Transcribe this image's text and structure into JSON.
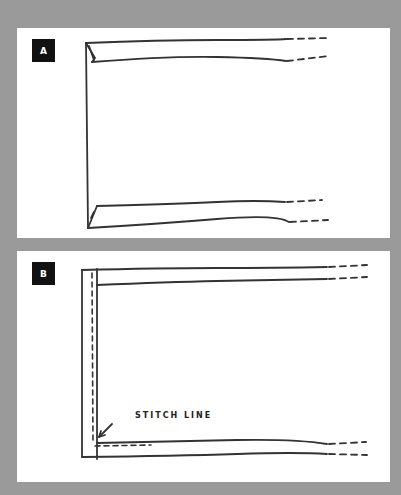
{
  "figure": {
    "panels": [
      {
        "id": "A",
        "badge": "A",
        "description": "Folded corner of fabric edge, unstitched"
      },
      {
        "id": "B",
        "badge": "B",
        "description": "Folded edge with stitch line",
        "annotation": "STITCH LINE"
      }
    ],
    "colors": {
      "background": "#9a9a9a",
      "panel": "#ffffff",
      "ink": "#333333",
      "badge": "#111111"
    }
  }
}
